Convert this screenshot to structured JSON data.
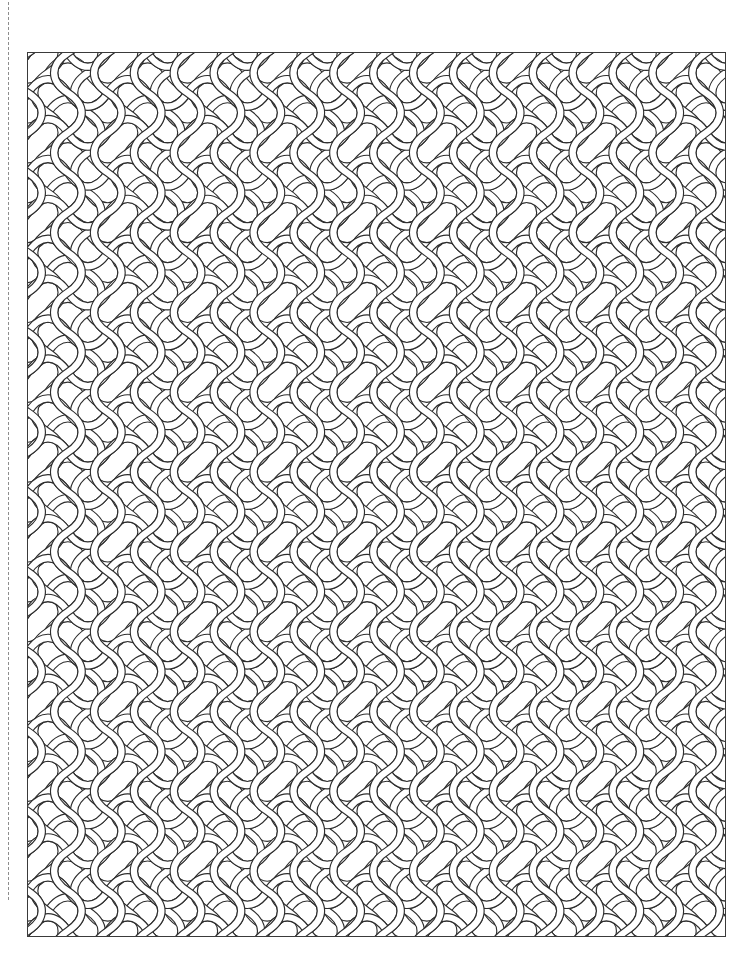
{
  "page": {
    "background_color": "#ffffff",
    "width": 752,
    "height": 978
  },
  "trim_guide": {
    "name": "trim-guide",
    "description": "vertical dashed trim line near left edge",
    "style": "dashed",
    "color": "#8d8d8d",
    "x": 8,
    "top": 2,
    "height": 898
  },
  "art_frame": {
    "name": "art-frame",
    "description": "rectangular border enclosing the knotwork field",
    "border_color": "#3a3a3a",
    "border_width": 1,
    "fill_color": "#ffffff",
    "x": 27,
    "y": 52,
    "width": 699,
    "height": 885
  },
  "pattern": {
    "name": "celtic-knot-interlace",
    "type": "seamless-interlace-lattice",
    "line_color": "#2e2e2e",
    "line_width": 1.15,
    "band_half_width": 3.1,
    "tile_width": 40,
    "tile_height": 40,
    "columns": 18,
    "rows": 23,
    "motif_notes": "Interwoven bands forming vertical pointed-oval eyes at tile centers, horizontal lens eyes at tile edges, and over/under crossings at the lattice nodes."
  }
}
